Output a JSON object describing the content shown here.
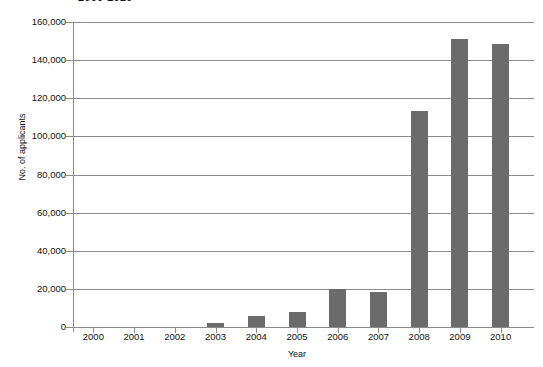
{
  "chart_data": {
    "type": "bar",
    "title": "2000-2010",
    "xlabel": "Year",
    "ylabel": "No. of applicants",
    "categories": [
      "2000",
      "2001",
      "2002",
      "2003",
      "2004",
      "2005",
      "2006",
      "2007",
      "2008",
      "2009",
      "2010"
    ],
    "values": [
      0,
      0,
      0,
      2000,
      6000,
      8000,
      20000,
      18500,
      113500,
      151000,
      148500
    ],
    "ylim": [
      0,
      160000
    ],
    "ytick_labels": [
      "160,000",
      "140,000",
      "120,000",
      "100,000",
      "80,000",
      "60,000",
      "40,000",
      "20,000",
      "0"
    ],
    "ytick_values": [
      160000,
      140000,
      120000,
      100000,
      80000,
      60000,
      40000,
      20000,
      0
    ],
    "grid": true,
    "legend": "none",
    "bar_color": "#6b6b6b",
    "axis_color": "#8a8a8a"
  }
}
